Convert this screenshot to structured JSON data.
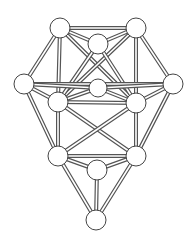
{
  "diagram": {
    "nodes": [
      {
        "id": "A",
        "label": "top-left"
      },
      {
        "id": "B",
        "label": "top-right"
      },
      {
        "id": "C",
        "label": "top-middle"
      },
      {
        "id": "D",
        "label": "left"
      },
      {
        "id": "E",
        "label": "right"
      },
      {
        "id": "F",
        "label": "center"
      },
      {
        "id": "G",
        "label": "middle-left"
      },
      {
        "id": "H",
        "label": "middle-right"
      },
      {
        "id": "I",
        "label": "lower-left"
      },
      {
        "id": "J",
        "label": "lower-right"
      },
      {
        "id": "K",
        "label": "lower-middle"
      },
      {
        "id": "L",
        "label": "bottom"
      }
    ],
    "edges": [
      [
        "A",
        "B"
      ],
      [
        "A",
        "C"
      ],
      [
        "B",
        "C"
      ],
      [
        "A",
        "D"
      ],
      [
        "A",
        "G"
      ],
      [
        "A",
        "H"
      ],
      [
        "B",
        "E"
      ],
      [
        "B",
        "H"
      ],
      [
        "B",
        "G"
      ],
      [
        "C",
        "G"
      ],
      [
        "C",
        "H"
      ],
      [
        "D",
        "E"
      ],
      [
        "D",
        "G"
      ],
      [
        "D",
        "F"
      ],
      [
        "D",
        "I"
      ],
      [
        "E",
        "H"
      ],
      [
        "E",
        "F"
      ],
      [
        "E",
        "J"
      ],
      [
        "G",
        "H"
      ],
      [
        "G",
        "F"
      ],
      [
        "H",
        "F"
      ],
      [
        "G",
        "I"
      ],
      [
        "G",
        "J"
      ],
      [
        "H",
        "J"
      ],
      [
        "H",
        "I"
      ],
      [
        "I",
        "J"
      ],
      [
        "I",
        "K"
      ],
      [
        "J",
        "K"
      ],
      [
        "I",
        "L"
      ],
      [
        "J",
        "L"
      ],
      [
        "K",
        "L"
      ]
    ]
  }
}
